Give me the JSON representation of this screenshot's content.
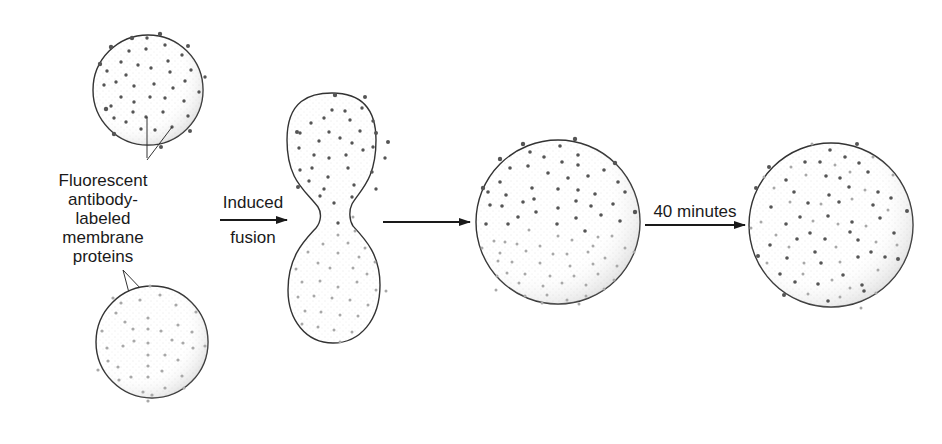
{
  "figure": {
    "labels": {
      "proteins_label": [
        "Fluorescent",
        "antibody-",
        "labeled",
        "membrane",
        "proteins"
      ],
      "fusion_top": "Induced",
      "fusion_bottom": "fusion",
      "time_label": "40 minutes"
    },
    "stages": [
      {
        "id": "cell-a",
        "name": "Cell with dark-labeled proteins"
      },
      {
        "id": "cell-b",
        "name": "Cell with light-labeled proteins"
      },
      {
        "id": "fusing-cells",
        "name": "Fusing cells (dumbbell)"
      },
      {
        "id": "hybrid-cell-segregated",
        "name": "Hybrid cell, proteins segregated"
      },
      {
        "id": "hybrid-cell-mixed",
        "name": "Hybrid cell, proteins intermixed"
      }
    ],
    "colors": {
      "outline": "#333333",
      "dark_dot": "#555555",
      "light_dot": "#a8a8a8",
      "stipple": "#bdbdbd",
      "text": "#1a1a1a"
    }
  }
}
